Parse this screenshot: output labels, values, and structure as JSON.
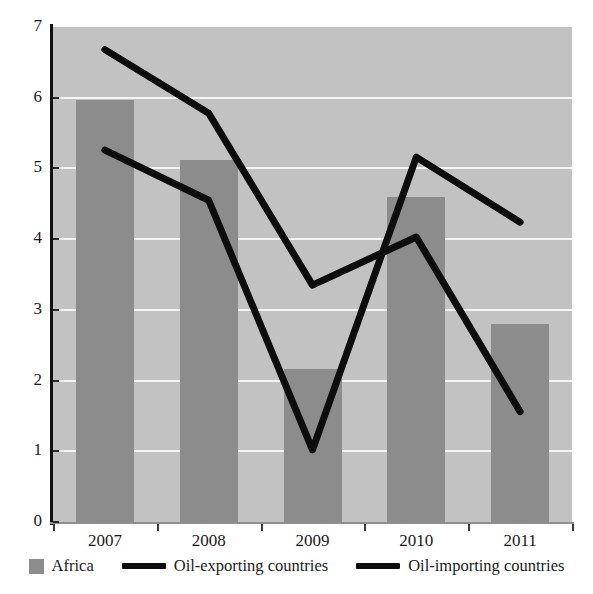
{
  "chart_data": {
    "type": "bar",
    "title": "",
    "xlabel": "",
    "ylabel": "",
    "categories": [
      "2007",
      "2008",
      "2009",
      "2010",
      "2011"
    ],
    "ylim": [
      0,
      7
    ],
    "y_ticks": [
      0,
      1,
      2,
      3,
      4,
      5,
      6,
      7
    ],
    "grid": true,
    "legend_position": "bottom",
    "series": [
      {
        "name": "Africa",
        "type": "bar",
        "color": "#8c8c8c",
        "values": [
          5.97,
          5.12,
          2.17,
          4.6,
          2.8
        ]
      },
      {
        "name": "Oil-exporting countries",
        "type": "line",
        "color": "#0d0d0d",
        "values": [
          6.68,
          5.78,
          3.35,
          4.03,
          1.56
        ]
      },
      {
        "name": "Oil-importing countries",
        "type": "line",
        "color": "#0d0d0d",
        "values": [
          5.26,
          4.55,
          1.02,
          5.16,
          4.24
        ]
      }
    ]
  },
  "axis": {
    "y_labels": [
      "7",
      "6",
      "5",
      "4",
      "3",
      "2",
      "1",
      "0"
    ],
    "x_labels": [
      "2007",
      "2008",
      "2009",
      "2010",
      "2011"
    ]
  },
  "legend": {
    "items": [
      {
        "label": "Africa",
        "marker": "square-swatch",
        "color": "#8c8c8c"
      },
      {
        "label": "Oil-exporting countries",
        "marker": "line-swatch",
        "color": "#0d0d0d"
      },
      {
        "label": "Oil-importing countries",
        "marker": "line-swatch",
        "color": "#0d0d0d"
      }
    ]
  }
}
